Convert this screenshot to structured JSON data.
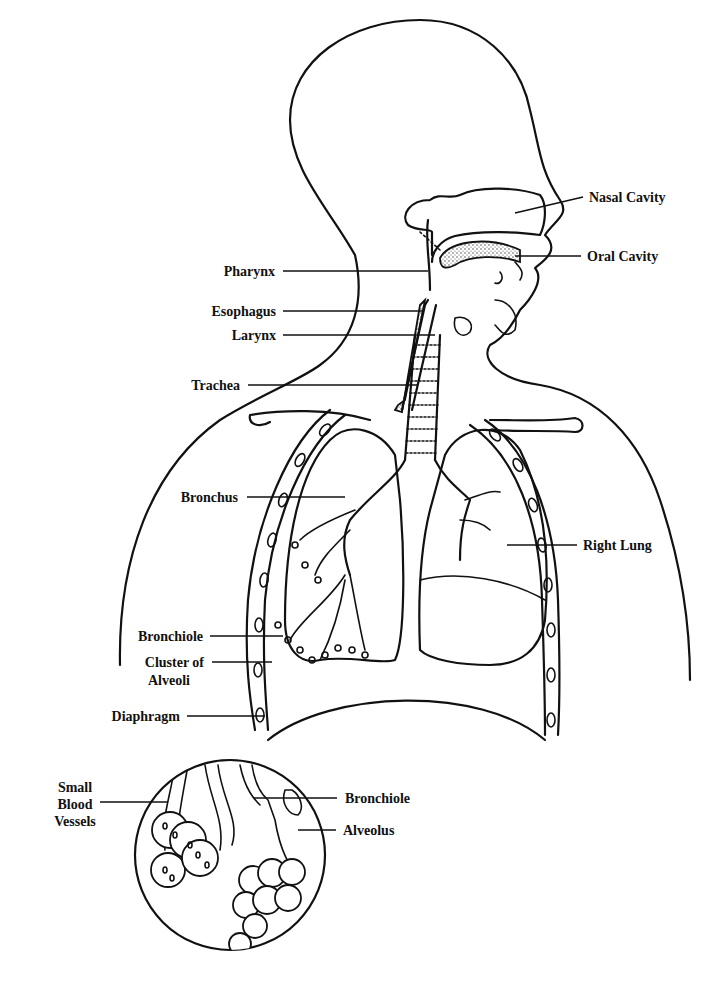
{
  "diagram": {
    "labels": [
      {
        "id": "nasal-cavity",
        "text": "Nasal Cavity"
      },
      {
        "id": "oral-cavity",
        "text": "Oral Cavity"
      },
      {
        "id": "pharynx",
        "text": "Pharynx"
      },
      {
        "id": "esophagus",
        "text": "Esophagus"
      },
      {
        "id": "larynx",
        "text": "Larynx"
      },
      {
        "id": "trachea",
        "text": "Trachea"
      },
      {
        "id": "bronchus",
        "text": "Bronchus"
      },
      {
        "id": "right-lung",
        "text": "Right Lung"
      },
      {
        "id": "bronchiole",
        "text": "Bronchiole"
      },
      {
        "id": "cluster-of-alveoli-1",
        "text": "Cluster of"
      },
      {
        "id": "cluster-of-alveoli-2",
        "text": "Alveoli"
      },
      {
        "id": "diaphragm",
        "text": "Diaphragm"
      }
    ],
    "inset": {
      "labels": [
        {
          "id": "small-blood-vessels-1",
          "text": "Small"
        },
        {
          "id": "small-blood-vessels-2",
          "text": "Blood"
        },
        {
          "id": "small-blood-vessels-3",
          "text": "Vessels"
        },
        {
          "id": "inset-bronchiole",
          "text": "Bronchiole"
        },
        {
          "id": "alveolus",
          "text": "Alveolus"
        }
      ]
    }
  }
}
